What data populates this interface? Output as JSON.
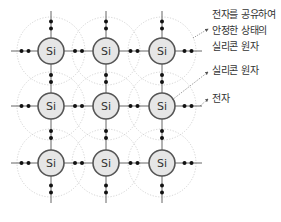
{
  "diagram": {
    "atom_symbol": "Si",
    "grid": {
      "columns_x": [
        51,
        106,
        162
      ],
      "rows_y": [
        51,
        106,
        163
      ]
    },
    "colors": {
      "atom_fill": "#e6e6e6",
      "atom_stroke": "#555555",
      "bond_line": "#666666",
      "electron": "#111111",
      "orbit": "#c8c8c8",
      "leader": "#555555",
      "text": "#333333"
    },
    "annotations": [
      {
        "id": "shared-electron-atom",
        "lines": [
          "전자를 공유하여",
          "안정한 상태의",
          "실리콘 원자"
        ]
      },
      {
        "id": "silicon-atom",
        "lines": [
          "실리콘 원자"
        ]
      },
      {
        "id": "electron",
        "lines": [
          "전자"
        ]
      }
    ]
  }
}
